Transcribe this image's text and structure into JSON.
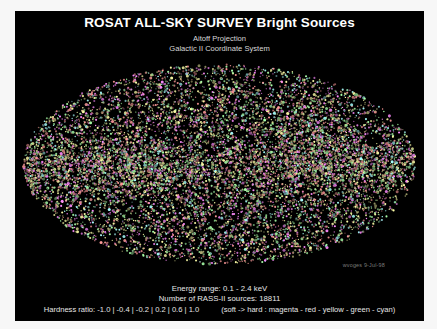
{
  "figure": {
    "background_color": "#ffffff",
    "panel_color": "#000000",
    "title": "ROSAT ALL-SKY SURVEY Bright Sources",
    "subtitle_1": "Aitoff Projection",
    "subtitle_2": "Galactic II Coordinate System"
  },
  "credit": {
    "text": "wvoges  9-Jul-98"
  },
  "footer": {
    "energy_range": "Energy range:  0.1 - 2.4 keV",
    "source_count": "Number of RASS-II sources:  18811",
    "hardness_ratio": "Hardness ratio: -1.0 | -0.4 | -0.2 | 0.2 | 0.6 | 1.0",
    "color_key": "(soft -> hard :  magenta - red - yellow - green - cyan)"
  },
  "chart_data": {
    "type": "scatter",
    "title": "ROSAT ALL-SKY SURVEY Bright Sources",
    "subtitle": "Aitoff Projection / Galactic II Coordinate System",
    "projection": "aitoff",
    "coordinate_system": "Galactic II",
    "xlabel": "Galactic longitude l (deg)",
    "ylabel": "Galactic latitude b (deg)",
    "xlim": [
      180,
      -180
    ],
    "ylim": [
      -90,
      90
    ],
    "grid": false,
    "legend_position": "bottom",
    "n_points": 18811,
    "point_count_label": "18811",
    "energy_range_keV": [
      0.1,
      2.4
    ],
    "energy_range_label": "0.1 - 2.4 keV",
    "hardness_ratio_bins": [
      -1.0,
      -0.4,
      -0.2,
      0.2,
      0.6,
      1.0
    ],
    "hardness_ratio_label": "-1.0 | -0.4 | -0.2 | 0.2 | 0.6 | 1.0",
    "colors": {
      "magenta": "#ff00ff",
      "red": "#ff2020",
      "yellow": "#ffff40",
      "green": "#40ff40",
      "cyan": "#40ffff"
    },
    "legend": [
      {
        "label": "magenta",
        "hardness_range": "-1.0 to -0.4",
        "color": "#ff00ff"
      },
      {
        "label": "red",
        "hardness_range": "-0.4 to -0.2",
        "color": "#ff2020"
      },
      {
        "label": "yellow",
        "hardness_range": "-0.2 to 0.2",
        "color": "#ffff40"
      },
      {
        "label": "green",
        "hardness_range": "0.2 to 0.6",
        "color": "#40ff40"
      },
      {
        "label": "cyan",
        "hardness_range": "0.6 to 1.0",
        "color": "#40ffff"
      }
    ],
    "series": [
      {
        "name": "magenta",
        "color": "#ff00ff",
        "fraction": 0.18
      },
      {
        "name": "red",
        "color": "#ff2020",
        "fraction": 0.22
      },
      {
        "name": "yellow",
        "color": "#ffff40",
        "fraction": 0.28
      },
      {
        "name": "green",
        "color": "#40ff40",
        "fraction": 0.2
      },
      {
        "name": "cyan",
        "color": "#40ffff",
        "fraction": 0.12
      }
    ],
    "density_notes": {
      "galactic_plane_enhancement": 2.4,
      "exposure_stripe_period_deg": 30,
      "north_ecliptic_pole_overdensity": true
    },
    "annotations": [
      {
        "text": "wvoges  9-Jul-98",
        "position": "lower-right"
      }
    ]
  }
}
